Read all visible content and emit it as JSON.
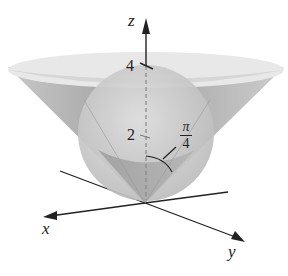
{
  "diagram": {
    "axes": {
      "x_label": "x",
      "y_label": "y",
      "z_label": "z"
    },
    "tick_labels": {
      "z_4": "4",
      "z_2": "2"
    },
    "angle_label": {
      "numerator": "π",
      "denominator": "4"
    },
    "colors": {
      "cone_outer": "#b3b3b3",
      "cone_rim": "#e6e6e6",
      "sphere": "#cfcfcf",
      "inner_cone": "#a0a0a0",
      "axis": "#222222"
    }
  }
}
